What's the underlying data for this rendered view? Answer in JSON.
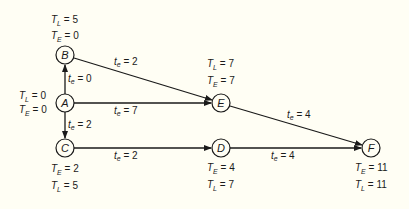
{
  "diagram": {
    "type": "activity-network (CPM/PERT)",
    "nodes": [
      {
        "id": "A",
        "label": "A",
        "x": 65,
        "y": 103,
        "TE": "0",
        "TL": "0"
      },
      {
        "id": "B",
        "label": "B",
        "x": 65,
        "y": 55,
        "TE": "0",
        "TL": "5"
      },
      {
        "id": "C",
        "label": "C",
        "x": 65,
        "y": 148,
        "TE": "2",
        "TL": "5"
      },
      {
        "id": "D",
        "label": "D",
        "x": 221,
        "y": 148,
        "TE": "4",
        "TL": "7"
      },
      {
        "id": "E",
        "label": "E",
        "x": 221,
        "y": 103,
        "TE": "7",
        "TL": "7"
      },
      {
        "id": "F",
        "label": "F",
        "x": 371,
        "y": 148,
        "TE": "11",
        "TL": "11"
      }
    ],
    "edges": [
      {
        "from": "A",
        "to": "B",
        "te": "0"
      },
      {
        "from": "A",
        "to": "C",
        "te": "2"
      },
      {
        "from": "A",
        "to": "E",
        "te": "7"
      },
      {
        "from": "B",
        "to": "E",
        "te": "2"
      },
      {
        "from": "C",
        "to": "D",
        "te": "2"
      },
      {
        "from": "D",
        "to": "F",
        "te": "4"
      },
      {
        "from": "E",
        "to": "F",
        "te": "4"
      }
    ],
    "symbols": {
      "te_var": "t",
      "te_sub": "e",
      "T_var": "T",
      "TL_sub": "L",
      "TE_sub": "E",
      "eq": " = "
    }
  }
}
